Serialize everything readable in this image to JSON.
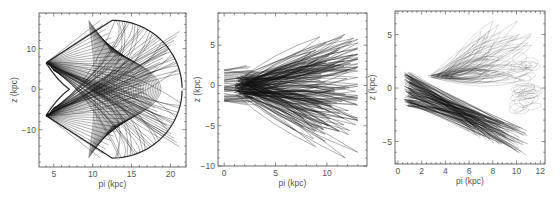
{
  "chart_data": [
    {
      "type": "line",
      "title": "",
      "xlabel": "pi (kpc)",
      "ylabel": "z (kpc)",
      "xlim": [
        3.1,
        22.0
      ],
      "ylim": [
        -19.2,
        18.8
      ],
      "xticks": [
        5,
        10,
        15,
        20
      ],
      "yticks": [
        -10,
        0,
        10
      ],
      "grid": false,
      "legend": null,
      "description": "Box orbit in meridional plane; dense mesh bounded by cusps at pi~4 (z=±6.5), apex pi~12.5 (z=±17), outer edge pi~21.5 (z=0), inner cusp pi~7 (z=0)",
      "envelope": {
        "pi_min": 4.0,
        "pi_max": 21.5,
        "z_max": 17.0,
        "inner_cusp_pi": 7.0,
        "corner_z": 6.5,
        "apex_pi": 12.5
      },
      "frame": {
        "x": 39,
        "y": 13,
        "w": 147,
        "h": 154
      },
      "stroke": "#111111",
      "stroke_opacity": 0.75,
      "n_lines": 70
    },
    {
      "type": "line",
      "title": "",
      "xlabel": "pi (kpc)",
      "ylabel": "z (kpc)",
      "xlim": [
        -0.6,
        13.9
      ],
      "ylim": [
        -10.0,
        9.0
      ],
      "xticks": [
        0,
        5,
        10
      ],
      "yticks": [
        -10,
        -5,
        0,
        5
      ],
      "grid": false,
      "legend": null,
      "description": "Chaotic/loop orbits fanning from inner region (pi 0-2, z ±2) outward to pi~13; upper reach z~8 at pi~8, lower reach z~-9 at pi~7",
      "envelope": {
        "core_pi": [
          0,
          2
        ],
        "core_z": 2.0,
        "pi_max": 13.0,
        "z_top": 8.2,
        "z_bottom": -9.0
      },
      "frame": {
        "x": 218,
        "y": 13,
        "w": 149,
        "h": 153
      },
      "stroke": "#111111",
      "stroke_opacity": 0.6,
      "n_lines": 110
    },
    {
      "type": "line",
      "title": "",
      "xlabel": "pi (kpc)",
      "ylabel": "z (kpc)",
      "xlim": [
        -0.25,
        12.4
      ],
      "ylim": [
        -7.1,
        7.2
      ],
      "xticks": [
        0,
        2,
        4,
        6,
        8,
        10,
        12
      ],
      "yticks": [
        -5,
        0,
        5
      ],
      "grid": false,
      "legend": null,
      "description": "Tilted orbit family: dense dark band descending from (0.5, 1.5) to (10, -4.5); lighter loops rising to z~6.3 at pi~8.5 and reaching pi~11.5",
      "envelope": {
        "start_pi": 0.5,
        "start_z": 1.5,
        "band_end_pi": 10.0,
        "band_end_z": -4.5,
        "upper_z": 6.3,
        "pi_max": 11.5,
        "lower_z": -6.2
      },
      "frame": {
        "x": 395,
        "y": 11,
        "w": 150,
        "h": 153
      },
      "stroke": "#111111",
      "stroke_opacity": 0.45,
      "n_lines": 120
    }
  ]
}
